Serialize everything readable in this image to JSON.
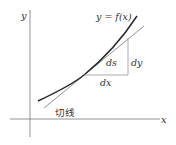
{
  "diagram": {
    "axes": {
      "x_label": "x",
      "y_label": "y"
    },
    "curve": {
      "label": "y = f(x)"
    },
    "tangent": {
      "label": "切线"
    },
    "triangle": {
      "ds_label": "ds",
      "dy_label": "dy",
      "dx_label": "dx"
    },
    "colors": {
      "curve": "#2a2a2a",
      "tangent": "#555555",
      "axes": "#666666",
      "triangle": "#777777",
      "text": "#333333"
    }
  }
}
